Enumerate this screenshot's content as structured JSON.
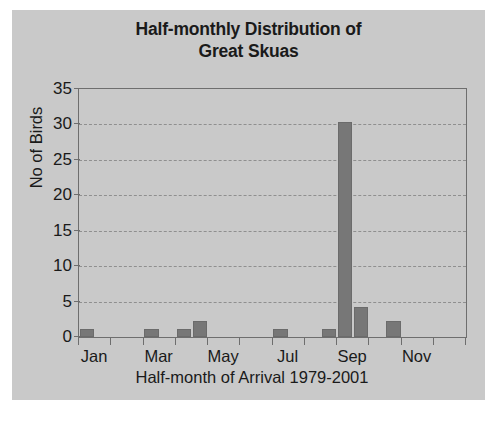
{
  "chart_data": {
    "type": "bar",
    "title": "Half-monthly Distribution of Great Skuas",
    "title_line1": "Half-monthly Distribution of",
    "title_line2": "Great Skuas",
    "xlabel": "Half-month of Arrival 1979-2001",
    "ylabel": "No of Birds",
    "ylim": [
      0,
      35
    ],
    "yticks": [
      0,
      5,
      10,
      15,
      20,
      25,
      30,
      35
    ],
    "ytick_labels": [
      "0",
      "5",
      "10",
      "15",
      "20",
      "25",
      "30",
      "35"
    ],
    "grid": "horizontal",
    "legend": "none",
    "bar_color": "#777777",
    "plot_background": "#c9c9c9",
    "categories": [
      "Jan-1",
      "Jan-2",
      "Feb-1",
      "Feb-2",
      "Mar-1",
      "Mar-2",
      "Apr-1",
      "Apr-2",
      "May-1",
      "May-2",
      "Jun-1",
      "Jun-2",
      "Jul-1",
      "Jul-2",
      "Aug-1",
      "Aug-2",
      "Sep-1",
      "Sep-2",
      "Oct-1",
      "Oct-2",
      "Nov-1",
      "Nov-2",
      "Dec-1",
      "Dec-2"
    ],
    "values": [
      1.2,
      0,
      0,
      0,
      1.2,
      0,
      1.2,
      2.3,
      0,
      0,
      0,
      0,
      1.2,
      0,
      0,
      1.2,
      30.3,
      4.3,
      0,
      2.3,
      0,
      0,
      0,
      0
    ],
    "xtick_labels": [
      "Jan",
      "Mar",
      "May",
      "Jul",
      "Sep",
      "Nov"
    ],
    "xtick_categories": [
      "Jan-1",
      "Mar-1",
      "May-1",
      "Jul-1",
      "Sep-1",
      "Nov-1"
    ]
  }
}
